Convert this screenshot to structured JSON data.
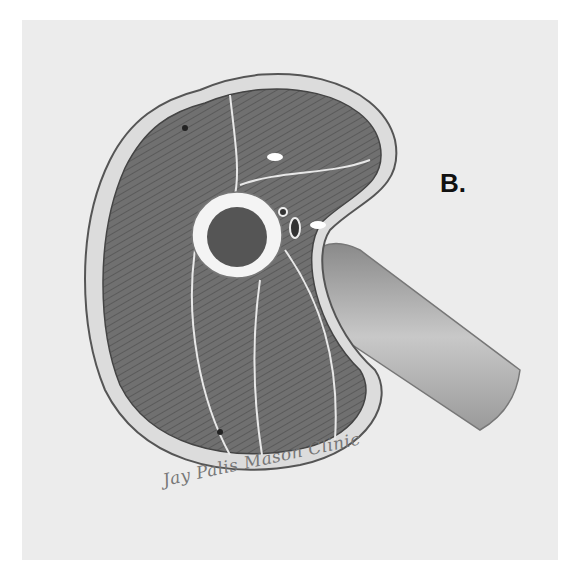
{
  "figure": {
    "panel_label": "B.",
    "signature": "Jay Palis Mason Clinic",
    "colors": {
      "background": "#ececec",
      "muscle": "#6e6e6e",
      "fascia": "#d8d8d8",
      "bone": "#f4f4f4",
      "marrow": "#555555",
      "limb": "#a8a8a8"
    }
  }
}
